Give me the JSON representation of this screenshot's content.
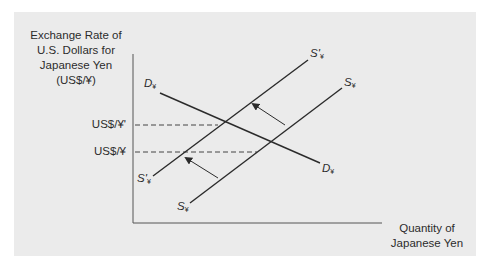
{
  "figure": {
    "type": "supply-demand diagram",
    "background_color": "#ebebeb",
    "line_color": "#2b2b2b"
  },
  "axes": {
    "y_label_lines": [
      "Exchange Rate of",
      "U.S. Dollars for",
      "Japanese Yen",
      "(US$/¥)"
    ],
    "x_label_lines": [
      "Quantity of",
      "Japanese Yen"
    ],
    "y_ticks": [
      {
        "label": "US$/¥'",
        "meaning": "new higher exchange rate"
      },
      {
        "label": "US$/¥",
        "meaning": "original exchange rate"
      }
    ]
  },
  "curves": {
    "demand": {
      "name": "D",
      "subscript": "¥",
      "top_label": "D",
      "bottom_label": "D"
    },
    "supply_original": {
      "name": "S",
      "subscript": "¥",
      "top_label": "S",
      "bottom_label": "S"
    },
    "supply_shifted": {
      "name": "S'",
      "subscript": "¥",
      "top_label": "S'",
      "bottom_label": "S'"
    }
  },
  "shift": {
    "direction": "leftward (supply decreases)",
    "arrow_count": 2
  }
}
